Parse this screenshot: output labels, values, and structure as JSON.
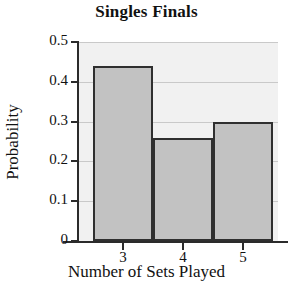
{
  "chart_data": {
    "type": "bar",
    "title": "Singles Finals",
    "xlabel": "Number of Sets Played",
    "ylabel": "Probability",
    "categories": [
      "3",
      "4",
      "5"
    ],
    "values": [
      0.44,
      0.26,
      0.3
    ],
    "ylim": [
      0,
      0.5
    ],
    "yticks": [
      "0.5",
      "0.4",
      "0.3",
      "0.2",
      "0.1",
      "0"
    ],
    "ytick_values": [
      0.5,
      0.4,
      0.3,
      0.2,
      0.1,
      0
    ],
    "grid": true,
    "legend": "none",
    "bar_fill_color": "#c2c2c2",
    "bar_edge_color": "#2f2f2f",
    "plot_background_color": "#f1f1f1",
    "gridline_color": "#c9c9c9",
    "axis_color": "#2b2b2b"
  }
}
